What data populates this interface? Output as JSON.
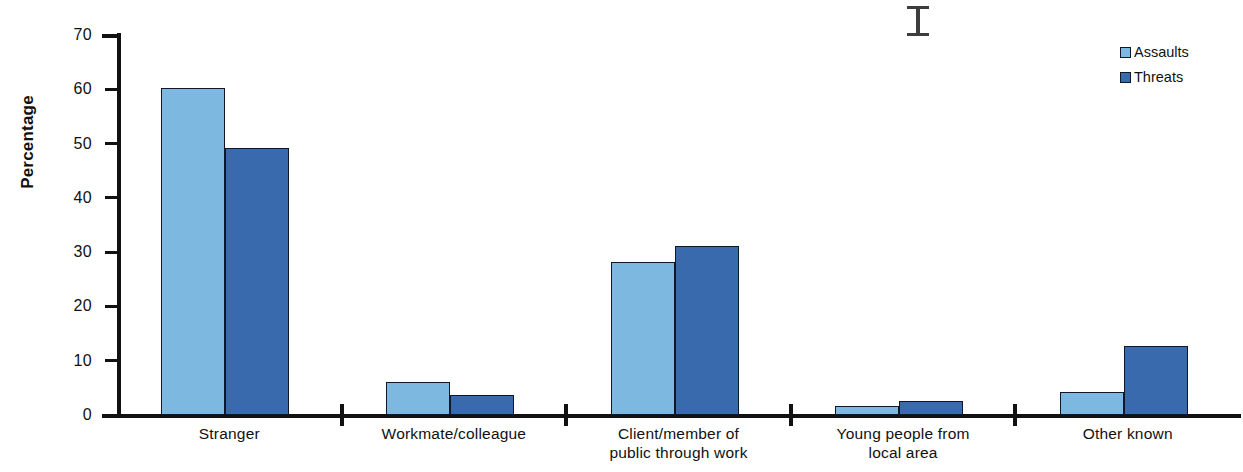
{
  "chart_data": {
    "type": "bar",
    "title": "",
    "xlabel": "",
    "ylabel": "Percentage",
    "ylim": [
      0,
      70
    ],
    "ytick_step": 10,
    "yticks": [
      0,
      10,
      20,
      30,
      40,
      50,
      60,
      70
    ],
    "grid": false,
    "legend_position": "top-right",
    "categories": [
      "Stranger",
      "Workmate/colleague",
      "Client/member of public through work",
      "Young people from local area",
      "Other known"
    ],
    "category_lines": [
      [
        "Stranger"
      ],
      [
        "Workmate/colleague"
      ],
      [
        "Client/member of",
        "public through work"
      ],
      [
        "Young people from",
        "local area"
      ],
      [
        "Other known"
      ]
    ],
    "series": [
      {
        "name": "Assaults",
        "color": "#7CB8E0",
        "values": [
          60.3,
          6.0,
          28.2,
          1.7,
          4.3
        ]
      },
      {
        "name": "Threats",
        "color": "#3A6AAE",
        "values": [
          49.2,
          3.7,
          31.1,
          2.6,
          12.7
        ]
      }
    ]
  },
  "legend": {
    "items": [
      {
        "label": "Assaults",
        "color": "#7CB8E0"
      },
      {
        "label": "Threats",
        "color": "#3A6AAE"
      }
    ]
  },
  "axis": {
    "y_title": "Percentage",
    "y_tick_labels": [
      "70",
      "60",
      "50",
      "40",
      "30",
      "20",
      "10",
      "0"
    ]
  },
  "artifacts": {
    "cursor": "i-beam-cursor"
  }
}
